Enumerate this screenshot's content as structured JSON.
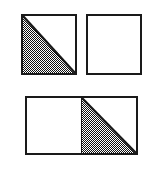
{
  "figure": {
    "canvas": {
      "width": 159,
      "height": 174,
      "background_color": "#ffffff"
    },
    "style": {
      "outline_color": "#1a1a1a",
      "outline_width_px": 2,
      "shaded_fill_color": "#a0a0a0",
      "shaded_fill_pattern": "checkerboard-dither-halftone",
      "unshaded_fill_color": "#ffffff",
      "diagonal_color": "#1a1a1a"
    },
    "groups": [
      {
        "name": "top-row",
        "arrangement": "two separate squares side by side",
        "shaded_fraction": "1/4",
        "shapes": [
          {
            "name": "square-top-left",
            "position": "left",
            "diagonal": "top-left-to-bottom-right",
            "shaded_region": "lower-left-triangle",
            "shaded": true,
            "fraction_shaded": "1/2"
          },
          {
            "name": "square-top-right",
            "position": "right",
            "diagonal": "none",
            "shaded_region": "none",
            "shaded": false,
            "fraction_shaded": "0"
          }
        ]
      },
      {
        "name": "bottom-row",
        "arrangement": "two squares joined along a shared vertical edge",
        "shaded_fraction": "1/4",
        "shapes": [
          {
            "name": "square-bottom-left",
            "position": "left",
            "diagonal": "none",
            "shaded_region": "none",
            "shaded": false,
            "fraction_shaded": "0"
          },
          {
            "name": "square-bottom-right",
            "position": "right",
            "diagonal": "top-left-to-bottom-right",
            "shaded_region": "lower-left-triangle",
            "shaded": true,
            "fraction_shaded": "1/2"
          }
        ]
      }
    ]
  }
}
